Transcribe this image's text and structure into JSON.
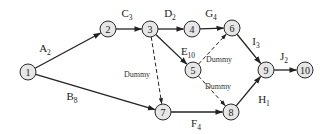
{
  "diagram": {
    "type": "activity-on-arrow network",
    "nodes": [
      {
        "id": "1",
        "label": "1",
        "x": 28,
        "y": 72
      },
      {
        "id": "2",
        "label": "2",
        "x": 108,
        "y": 29
      },
      {
        "id": "3",
        "label": "3",
        "x": 150,
        "y": 29
      },
      {
        "id": "4",
        "label": "4",
        "x": 192,
        "y": 29
      },
      {
        "id": "5",
        "label": "5",
        "x": 193,
        "y": 70
      },
      {
        "id": "6",
        "label": "6",
        "x": 232,
        "y": 28
      },
      {
        "id": "7",
        "label": "7",
        "x": 163,
        "y": 112
      },
      {
        "id": "8",
        "label": "8",
        "x": 231,
        "y": 112
      },
      {
        "id": "9",
        "label": "9",
        "x": 266,
        "y": 70
      },
      {
        "id": "10",
        "label": "10",
        "x": 305,
        "y": 70
      }
    ],
    "edges": [
      {
        "from": "1",
        "to": "2",
        "activity": "A",
        "duration": "2",
        "dummy": false,
        "lx": 45,
        "ly": 52
      },
      {
        "from": "1",
        "to": "7",
        "activity": "B",
        "duration": "8",
        "dummy": false,
        "lx": 72,
        "ly": 100
      },
      {
        "from": "2",
        "to": "3",
        "activity": "C",
        "duration": "3",
        "dummy": false,
        "lx": 127,
        "ly": 17
      },
      {
        "from": "3",
        "to": "4",
        "activity": "D",
        "duration": "2",
        "dummy": false,
        "lx": 170,
        "ly": 17
      },
      {
        "from": "4",
        "to": "6",
        "activity": "G",
        "duration": "4",
        "dummy": false,
        "lx": 211,
        "ly": 17
      },
      {
        "from": "3",
        "to": "5",
        "activity": "E",
        "duration": "10",
        "dummy": false,
        "lx": 188,
        "ly": 55
      },
      {
        "from": "6",
        "to": "9",
        "activity": "I",
        "duration": "3",
        "dummy": false,
        "lx": 256,
        "ly": 45
      },
      {
        "from": "9",
        "to": "10",
        "activity": "J",
        "duration": "2",
        "dummy": false,
        "lx": 284,
        "ly": 60
      },
      {
        "from": "8",
        "to": "9",
        "activity": "H",
        "duration": "1",
        "dummy": false,
        "lx": 264,
        "ly": 103
      },
      {
        "from": "7",
        "to": "8",
        "activity": "F",
        "duration": "4",
        "dummy": false,
        "lx": 196,
        "ly": 127
      },
      {
        "from": "3",
        "to": "7",
        "activity": "Dummy",
        "duration": "",
        "dummy": true,
        "lx": 137,
        "ly": 77
      },
      {
        "from": "5",
        "to": "6",
        "activity": "Dummy",
        "duration": "",
        "dummy": true,
        "lx": 219,
        "ly": 62
      },
      {
        "from": "5",
        "to": "8",
        "activity": "Dummy",
        "duration": "",
        "dummy": true,
        "lx": 218,
        "ly": 89
      }
    ]
  },
  "style": {
    "node_fill": "#e6e6e6",
    "stroke": "#222222",
    "background": "#ffffff"
  }
}
